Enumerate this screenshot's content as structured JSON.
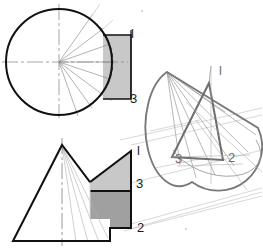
{
  "figure": {
    "colors": {
      "outline_dark": "#111111",
      "outline_mid": "#6e6e6e",
      "projection_line": "#b0b0b0",
      "centerline": "#7a7a7a",
      "shade_light": "#c8c8c8",
      "shade_medium": "#a0a0a0",
      "background": "#ffffff"
    }
  },
  "plan_view": {
    "name": "plan-view-circle",
    "description": "Circle representing the cone base in plan with radial generator lines fanning from the centre, a dashed hidden arc, horizontal and vertical centrelines, and a shaded rectangular auxiliary face at the right.",
    "labels": [
      {
        "text": "l",
        "x": 131,
        "y": 38
      },
      {
        "text": "3",
        "x": 130,
        "y": 103
      }
    ]
  },
  "elevation_view": {
    "name": "elevation-view-triangle",
    "description": "Triangular elevation of the cone with a vertical dash-dot centreline, generator lines from the apex to the base, and a two-tone shaded quadrilateral showing the cutting plane.",
    "labels": [
      {
        "text": "l",
        "x": 137,
        "y": 155
      },
      {
        "text": "3",
        "x": 136,
        "y": 188
      },
      {
        "text": "2",
        "x": 137,
        "y": 232
      }
    ]
  },
  "pictorial_view": {
    "name": "pictorial-view-oblique-cone",
    "description": "Pictorial oblique cone with apex at upper left, elliptical base and an inscribed triangle joining points 1, 2 and 3.",
    "labels": [
      {
        "text": "l",
        "x": 219,
        "y": 75
      },
      {
        "text": "3",
        "x": 175,
        "y": 163
      },
      {
        "text": "2",
        "x": 228,
        "y": 162
      }
    ]
  },
  "projection_lines": {
    "name": "projection-lines",
    "description": "Thin light construction lines carrying points 1, 2 and 3 from the elevation across to the pictorial view."
  }
}
